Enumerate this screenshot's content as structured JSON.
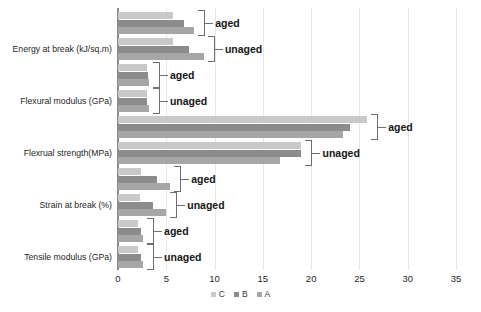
{
  "chart_data": {
    "type": "bar",
    "orientation": "horizontal",
    "title": "",
    "xlabel": "",
    "ylabel": "",
    "xlim": [
      0,
      35
    ],
    "xticks": [
      0,
      5,
      10,
      15,
      20,
      25,
      30,
      35
    ],
    "xtick_labels": [
      "0",
      "5",
      "10",
      "15",
      "20",
      "25",
      "30",
      "35"
    ],
    "grid": true,
    "grid_axis": "x",
    "legend": {
      "position": "bottom",
      "entries": [
        {
          "name": "C",
          "color": "#c9c9c9"
        },
        {
          "name": "B",
          "color": "#8c8c8c"
        },
        {
          "name": "A",
          "color": "#a6a6a6"
        }
      ]
    },
    "categories": [
      "Energy at break (kJ/sq.m)",
      "Flexural modulus (GPa)",
      "Flexrual strength(MPa)",
      "Strain at break (%)",
      "Tensile modulus (GPa)"
    ],
    "conditions": [
      "aged",
      "unaged"
    ],
    "series": [
      {
        "name": "C",
        "color": "#c9c9c9",
        "values": {
          "Energy at break (kJ/sq.m)": {
            "aged": 5.7,
            "unaged": 5.7
          },
          "Flexural modulus (GPa)": {
            "aged": 3.0,
            "unaged": 3.0
          },
          "Flexrual strength(MPa)": {
            "aged": 25.8,
            "unaged": 19.0
          },
          "Strain at break (%)": {
            "aged": 2.4,
            "unaged": 2.3
          },
          "Tensile modulus (GPa)": {
            "aged": 2.1,
            "unaged": 2.1
          }
        }
      },
      {
        "name": "B",
        "color": "#8c8c8c",
        "values": {
          "Energy at break (kJ/sq.m)": {
            "aged": 6.8,
            "unaged": 7.4
          },
          "Flexural modulus (GPa)": {
            "aged": 3.1,
            "unaged": 3.0
          },
          "Flexrual strength(MPa)": {
            "aged": 24.0,
            "unaged": 19.0
          },
          "Strain at break (%)": {
            "aged": 4.0,
            "unaged": 3.6
          },
          "Tensile modulus (GPa)": {
            "aged": 2.4,
            "unaged": 2.4
          }
        }
      },
      {
        "name": "A",
        "color": "#a6a6a6",
        "values": {
          "Energy at break (kJ/sq.m)": {
            "aged": 7.9,
            "unaged": 8.9
          },
          "Flexural modulus (GPa)": {
            "aged": 3.2,
            "unaged": 3.2
          },
          "Flexrual strength(MPa)": {
            "aged": 23.3,
            "unaged": 16.8
          },
          "Strain at break (%)": {
            "aged": 5.4,
            "unaged": 5.0
          },
          "Tensile modulus (GPa)": {
            "aged": 2.6,
            "unaged": 2.6
          }
        }
      }
    ],
    "group_labels": [
      {
        "category": "Energy at break (kJ/sq.m)",
        "condition": "aged"
      },
      {
        "category": "Energy at break (kJ/sq.m)",
        "condition": "unaged"
      },
      {
        "category": "Flexural modulus (GPa)",
        "condition": "aged"
      },
      {
        "category": "Flexural modulus (GPa)",
        "condition": "unaged"
      },
      {
        "category": "Flexrual strength(MPa)",
        "condition": "aged"
      },
      {
        "category": "Flexrual strength(MPa)",
        "condition": "unaged"
      },
      {
        "category": "Strain at break (%)",
        "condition": "aged"
      },
      {
        "category": "Strain at break (%)",
        "condition": "unaged"
      },
      {
        "category": "Tensile modulus (GPa)",
        "condition": "aged"
      },
      {
        "category": "Tensile modulus (GPa)",
        "condition": "unaged"
      }
    ]
  }
}
